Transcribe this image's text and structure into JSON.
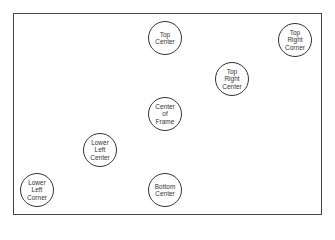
{
  "diagram": {
    "frame_label": "Camera frame",
    "markers": [
      {
        "id": "top-center",
        "lines": [
          "Top",
          "Center"
        ]
      },
      {
        "id": "top-right-corner",
        "lines": [
          "Top",
          "Right",
          "Corner"
        ]
      },
      {
        "id": "top-right-center",
        "lines": [
          "Top",
          "Right",
          "Center"
        ]
      },
      {
        "id": "center-of-frame",
        "lines": [
          "Center",
          "of",
          "Frame"
        ]
      },
      {
        "id": "lower-left-center",
        "lines": [
          "Lower",
          "Left",
          "Center"
        ]
      },
      {
        "id": "lower-left-corner",
        "lines": [
          "Lower",
          "Left",
          "Corner"
        ]
      },
      {
        "id": "bottom-center",
        "lines": [
          "Bottom",
          "Center"
        ]
      }
    ]
  }
}
